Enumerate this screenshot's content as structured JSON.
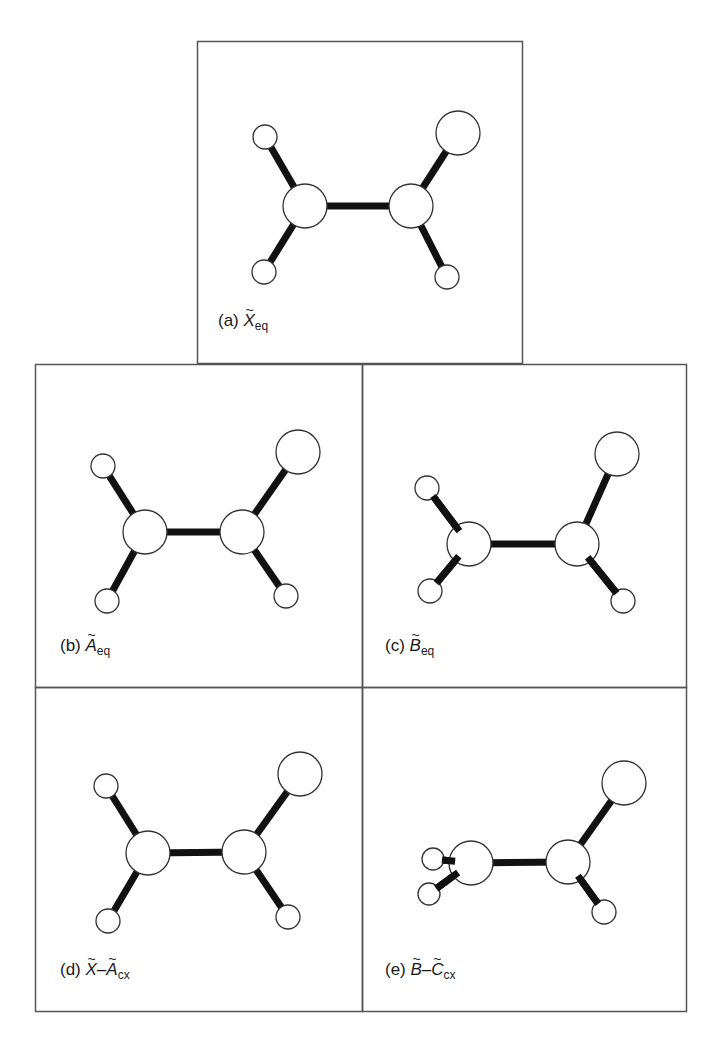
{
  "figure": {
    "frame_color": "#555555",
    "bond_color": "#111111",
    "atom_fill": "#ffffff",
    "atom_stroke": "#333333",
    "panels": [
      {
        "id": "a",
        "prefix": "(a)",
        "symbols": [
          "X"
        ],
        "separator": "",
        "subscript": "eq",
        "box": {
          "x": 197,
          "y": 41,
          "w": 325,
          "h": 322
        },
        "label_pos": {
          "x": 218,
          "y": 323
        },
        "atoms": [
          {
            "role": "C1",
            "x": 305,
            "y": 206,
            "r": 22
          },
          {
            "role": "C2",
            "x": 411,
            "y": 206,
            "r": 22
          },
          {
            "role": "H-top-left",
            "x": 265,
            "y": 137,
            "r": 12
          },
          {
            "role": "H-bottom-left",
            "x": 264,
            "y": 272,
            "r": 12
          },
          {
            "role": "X-top-right",
            "x": 458,
            "y": 133,
            "r": 22
          },
          {
            "role": "H-bottom-right",
            "x": 447,
            "y": 277,
            "r": 12
          }
        ],
        "bonds": [
          [
            0,
            1
          ],
          [
            0,
            2
          ],
          [
            0,
            3
          ],
          [
            1,
            4
          ],
          [
            1,
            5
          ]
        ]
      },
      {
        "id": "b",
        "prefix": "(b)",
        "symbols": [
          "A"
        ],
        "separator": "",
        "subscript": "eq",
        "box": {
          "x": 35,
          "y": 364,
          "w": 327,
          "h": 323
        },
        "label_pos": {
          "x": 60,
          "y": 648
        },
        "atoms": [
          {
            "role": "C1",
            "x": 145,
            "y": 532,
            "r": 22
          },
          {
            "role": "C2",
            "x": 242,
            "y": 532,
            "r": 22
          },
          {
            "role": "H-top-left",
            "x": 103,
            "y": 466,
            "r": 12
          },
          {
            "role": "H-bottom-left",
            "x": 107,
            "y": 601,
            "r": 12
          },
          {
            "role": "X-top-right",
            "x": 298,
            "y": 452,
            "r": 22
          },
          {
            "role": "H-bottom-right",
            "x": 286,
            "y": 596,
            "r": 12
          }
        ],
        "bonds": [
          [
            0,
            1
          ],
          [
            0,
            2
          ],
          [
            0,
            3
          ],
          [
            1,
            4
          ],
          [
            1,
            5
          ]
        ]
      },
      {
        "id": "c",
        "prefix": "(c)",
        "symbols": [
          "B"
        ],
        "separator": "",
        "subscript": "eq",
        "box": {
          "x": 362,
          "y": 364,
          "w": 324,
          "h": 323
        },
        "label_pos": {
          "x": 385,
          "y": 648
        },
        "atoms": [
          {
            "role": "C1",
            "x": 469,
            "y": 544,
            "r": 22
          },
          {
            "role": "C2",
            "x": 577,
            "y": 544,
            "r": 22
          },
          {
            "role": "H-top-left",
            "x": 427,
            "y": 488,
            "r": 12
          },
          {
            "role": "H-bottom-left",
            "x": 430,
            "y": 591,
            "r": 12
          },
          {
            "role": "X-top-right",
            "x": 617,
            "y": 454,
            "r": 22
          },
          {
            "role": "H-bottom-right",
            "x": 623,
            "y": 601,
            "r": 12
          }
        ],
        "bonds": [
          [
            0,
            1
          ],
          [
            0,
            2
          ],
          [
            0,
            3
          ],
          [
            1,
            4
          ],
          [
            1,
            5
          ]
        ]
      },
      {
        "id": "d",
        "prefix": "(d)",
        "symbols": [
          "X",
          "A"
        ],
        "separator": "–",
        "subscript": "cx",
        "box": {
          "x": 35,
          "y": 687,
          "w": 327,
          "h": 324
        },
        "label_pos": {
          "x": 60,
          "y": 972
        },
        "atoms": [
          {
            "role": "C1",
            "x": 148,
            "y": 853,
            "r": 22
          },
          {
            "role": "C2",
            "x": 244,
            "y": 852,
            "r": 22
          },
          {
            "role": "H-top-left",
            "x": 106,
            "y": 786,
            "r": 12
          },
          {
            "role": "H-bottom-left",
            "x": 108,
            "y": 921,
            "r": 12
          },
          {
            "role": "X-top-right",
            "x": 300,
            "y": 774,
            "r": 22
          },
          {
            "role": "H-bottom-right",
            "x": 288,
            "y": 917,
            "r": 12
          }
        ],
        "bonds": [
          [
            0,
            1
          ],
          [
            0,
            2
          ],
          [
            0,
            3
          ],
          [
            1,
            4
          ],
          [
            1,
            5
          ]
        ]
      },
      {
        "id": "e",
        "prefix": "(e)",
        "symbols": [
          "B",
          "C"
        ],
        "separator": "–",
        "subscript": "cx",
        "box": {
          "x": 362,
          "y": 687,
          "w": 324,
          "h": 324
        },
        "label_pos": {
          "x": 385,
          "y": 972
        },
        "atoms": [
          {
            "role": "C1",
            "x": 471,
            "y": 863,
            "r": 22
          },
          {
            "role": "C2",
            "x": 568,
            "y": 862,
            "r": 22
          },
          {
            "role": "H-upper-left",
            "x": 433,
            "y": 859,
            "r": 11
          },
          {
            "role": "H-lower-left",
            "x": 429,
            "y": 894,
            "r": 11
          },
          {
            "role": "X-top-right",
            "x": 624,
            "y": 783,
            "r": 22
          },
          {
            "role": "H-bottom-right",
            "x": 604,
            "y": 912,
            "r": 12
          }
        ],
        "bonds": [
          [
            0,
            1
          ],
          [
            0,
            2
          ],
          [
            0,
            3
          ],
          [
            1,
            4
          ],
          [
            1,
            5
          ]
        ]
      }
    ]
  }
}
